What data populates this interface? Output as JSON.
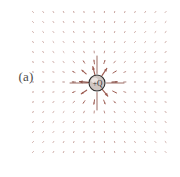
{
  "figure": {
    "panel_label": "(a)",
    "caption_present": false,
    "background_color": "#ffffff"
  },
  "charge": {
    "label": "+Q",
    "sign": "+",
    "symbol": "Q",
    "center_x": 97,
    "center_y": 83,
    "radius": 8,
    "fill_color": "#cfc6c2",
    "stroke_color": "#2b2b2b",
    "highlight_color": "#efe9e6"
  },
  "field": {
    "description": "electric-field-vectors-radial-outward",
    "arrow_color": "#9d5c52",
    "axis_arrow_color": "#8a5048",
    "origin_x": 97,
    "origin_y": 83,
    "grid": {
      "columns": 14,
      "rows": 15,
      "x_start": 33,
      "y_start": 12,
      "spacing_x": 10.2,
      "spacing_y": 10.0
    },
    "scaling": {
      "law": "inverse-square",
      "max_arrow_length": 11,
      "min_arrow_length": 1.2,
      "inner_cutoff_radius": 11
    }
  },
  "chart_data": {
    "type": "scatter",
    "title": "",
    "xlabel": "",
    "ylabel": "",
    "grid": false,
    "legend": null,
    "annotations": [
      "(a)",
      "+Q"
    ]
  }
}
